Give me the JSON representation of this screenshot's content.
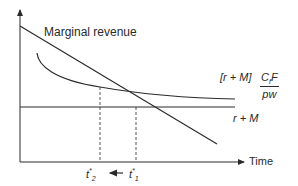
{
  "diagram": {
    "title_label": "Marginal revenue",
    "x_axis_label": "Time",
    "curves": [
      {
        "name": "marginal-revenue",
        "label": "Marginal revenue",
        "shape": "decreasing line"
      },
      {
        "name": "cost-curve",
        "label_prefix": "[r + M]",
        "label_numerator": "C",
        "label_numerator_sub": "f",
        "label_numerator_suffix": "F",
        "label_denominator": "pw",
        "shape": "decreasing convex curve approaching asymptote"
      },
      {
        "name": "r-plus-m",
        "label": "r + M",
        "shape": "horizontal line"
      }
    ],
    "markers": [
      {
        "name": "t-star-2",
        "base": "t",
        "sup": "*",
        "sub": "2"
      },
      {
        "name": "t-star-1",
        "base": "t",
        "sup": "*",
        "sub": "1"
      }
    ],
    "shift_arrow": "left",
    "colors": {
      "line": "#2a2a2a",
      "background": "#ffffff"
    }
  }
}
